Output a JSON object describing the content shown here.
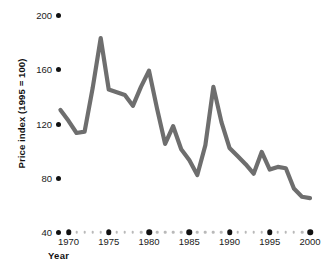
{
  "chart_data": {
    "type": "line",
    "title": "",
    "xlabel": "Year",
    "ylabel": "Price index (1995 = 100)",
    "xlim": [
      1969,
      2000
    ],
    "ylim": [
      40,
      200
    ],
    "grid": false,
    "legend": null,
    "line_color": "#6e6e6e",
    "marker_color": "#111111",
    "minor_dot_color": "#b9b9b9",
    "y_ticks": [
      200,
      160,
      120,
      80,
      40
    ],
    "y_tick_labels": [
      "200",
      "160",
      "120",
      "80",
      "40"
    ],
    "x_ticks": [
      1970,
      1975,
      1980,
      1985,
      1990,
      1995,
      2000
    ],
    "x_tick_labels": [
      "1970",
      "1975",
      "1980",
      "1985",
      "1990",
      "1995",
      "2000"
    ],
    "x_minor_ticks": [
      1971,
      1972,
      1973,
      1974,
      1976,
      1977,
      1978,
      1979,
      1981,
      1982,
      1983,
      1984,
      1986,
      1987,
      1988,
      1989,
      1991,
      1992,
      1993,
      1994,
      1996,
      1997,
      1998,
      1999
    ],
    "x": [
      1969,
      1970,
      1971,
      1972,
      1973,
      1974,
      1975,
      1976,
      1977,
      1978,
      1979,
      1980,
      1981,
      1982,
      1983,
      1984,
      1985,
      1986,
      1987,
      1988,
      1989,
      1990,
      1991,
      1992,
      1993,
      1994,
      1995,
      1996,
      1997,
      1998,
      1999,
      2000
    ],
    "values": [
      130,
      122,
      113,
      114,
      146,
      183,
      145,
      143,
      141,
      133,
      147,
      159,
      131,
      105,
      118,
      101,
      93,
      82,
      104,
      147,
      121,
      102,
      96,
      90,
      83,
      99,
      86,
      88,
      87,
      72,
      66,
      65
    ],
    "series": [
      {
        "name": "Price index",
        "values": [
          130,
          122,
          113,
          114,
          146,
          183,
          145,
          143,
          141,
          133,
          147,
          159,
          131,
          105,
          118,
          101,
          93,
          82,
          104,
          147,
          121,
          102,
          96,
          90,
          83,
          99,
          86,
          88,
          87,
          72,
          66,
          65
        ]
      }
    ],
    "annotations": []
  }
}
